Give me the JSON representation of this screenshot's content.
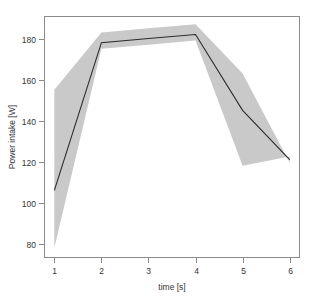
{
  "chart_data": {
    "type": "line",
    "title": "",
    "subtitle": "",
    "xlabel": "time [s]",
    "ylabel": "Power intake [W]",
    "x": [
      1,
      2,
      3,
      4,
      5,
      6
    ],
    "xticks": [
      "1",
      "2",
      "3",
      "4",
      "5",
      "6"
    ],
    "yticks": [
      "80",
      "100",
      "120",
      "140",
      "160",
      "180"
    ],
    "ytick_values": [
      80,
      100,
      120,
      140,
      160,
      180
    ],
    "xlim": [
      0.78,
      6.22
    ],
    "ylim": [
      73,
      191
    ],
    "grid": false,
    "legend": false,
    "legend_position": "none",
    "series": [
      {
        "name": "mean",
        "kind": "line",
        "values": [
          106,
          178,
          180,
          182,
          145,
          121
        ]
      },
      {
        "name": "band",
        "kind": "area",
        "upper": [
          155,
          183,
          185,
          187,
          163,
          119.5
        ],
        "lower": [
          78,
          175,
          177,
          179,
          118,
          122.5
        ]
      }
    ],
    "annotations": []
  },
  "style": {
    "band_color": "#c9c9c9",
    "line_color": "#2b2b2b",
    "line_width": 1.1,
    "frame_color": "#8a8a8a",
    "text_color": "#333333",
    "background": "#ffffff"
  },
  "geometry": {
    "plot_left": 44,
    "plot_right": 300,
    "plot_top": 16,
    "plot_bottom": 258
  }
}
